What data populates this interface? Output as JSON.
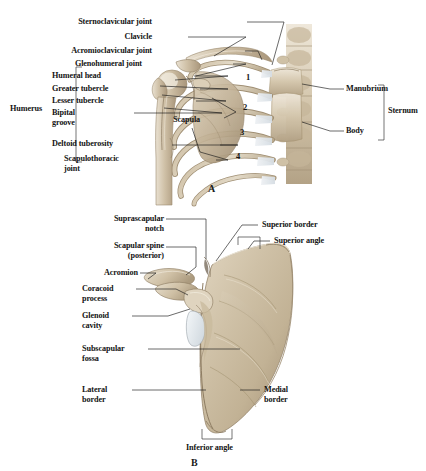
{
  "figure": {
    "background_color": "#ffffff",
    "bone_color": "#cdbfa8",
    "cartilage_color": "#e2e6ea",
    "leader_color": "#1b1b1b"
  },
  "panelA": {
    "letter": "A",
    "subject": "Anterior view of right shoulder girdle and thorax",
    "left_labels": [
      {
        "text": "Sternoclavicular joint",
        "x": 152,
        "y": 22
      },
      {
        "text": "Clavicle",
        "x": 152,
        "y": 37
      },
      {
        "text": "Acromioclavicular joint",
        "x": 152,
        "y": 51
      },
      {
        "text": "Glenohumeral joint",
        "x": 142,
        "y": 64
      },
      {
        "text": "Humeral head",
        "x": 123,
        "y": 76
      },
      {
        "text": "Greater tubercle",
        "x": 131,
        "y": 89
      },
      {
        "text": "Lesser tubercle",
        "x": 126,
        "y": 101
      },
      {
        "text": "Bipital\ngroove",
        "x": 96,
        "y": 113
      },
      {
        "text": "Deltoid tuberosity",
        "x": 136,
        "y": 144
      },
      {
        "text": "Scapulothoracic\njoint",
        "x": 144,
        "y": 159
      }
    ],
    "bracket_labels": [
      {
        "text": "Humerus",
        "x": 44,
        "y": 108
      },
      {
        "text": "Sternum",
        "x": 398,
        "y": 110
      }
    ],
    "right_labels": [
      {
        "text": "Manubrium",
        "x": 348,
        "y": 89
      },
      {
        "text": "Body",
        "x": 348,
        "y": 131
      }
    ],
    "inline_labels": [
      {
        "text": "Scapula",
        "x": 197,
        "y": 120
      }
    ],
    "rib_numbers": [
      {
        "text": "1",
        "x": 248,
        "y": 78
      },
      {
        "text": "2",
        "x": 245,
        "y": 108
      },
      {
        "text": "3",
        "x": 242,
        "y": 133
      },
      {
        "text": "4",
        "x": 238,
        "y": 157
      }
    ]
  },
  "panelB": {
    "letter": "B",
    "subject": "Anterior (costal) view of right scapula",
    "left_labels": [
      {
        "text": "Suprascapular\nnotch",
        "x": 91,
        "y": 219
      },
      {
        "text": "Scapular spine\n(posterior)",
        "x": 91,
        "y": 246
      },
      {
        "text": "Acromion",
        "x": 91,
        "y": 272
      },
      {
        "text": "Coracoid\nprocess",
        "x": 91,
        "y": 288
      },
      {
        "text": "Glenoid\ncavity",
        "x": 91,
        "y": 315
      },
      {
        "text": "Subscapular\nfossa",
        "x": 91,
        "y": 348
      },
      {
        "text": "Lateral\nborder",
        "x": 91,
        "y": 389
      }
    ],
    "right_labels": [
      {
        "text": "Superior border",
        "x": 262,
        "y": 224
      },
      {
        "text": "Superior angle",
        "x": 274,
        "y": 240
      },
      {
        "text": "Medial\nborder",
        "x": 264,
        "y": 389
      }
    ],
    "bottom_labels": [
      {
        "text": "Inferior angle",
        "x": 220,
        "y": 444
      }
    ]
  }
}
